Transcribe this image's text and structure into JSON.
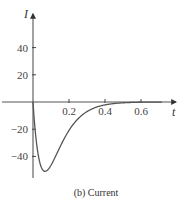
{
  "chart_data": {
    "type": "line",
    "title": "",
    "caption": "(b) Current",
    "xlabel": "t",
    "ylabel": "I",
    "xlim": [
      0,
      0.72
    ],
    "ylim": [
      -55,
      60
    ],
    "x_ticks": [
      0.2,
      0.4,
      0.6
    ],
    "x_tick_labels": [
      "0.2",
      "0.4",
      "0.6"
    ],
    "y_ticks": [
      40,
      20,
      -20,
      -40
    ],
    "y_tick_labels": [
      "40",
      "20",
      "−20",
      "−40"
    ],
    "grid": false,
    "legend": null,
    "series": [
      {
        "name": "I(t)",
        "color": "#555555",
        "x": [
          0,
          0.01,
          0.02,
          0.03,
          0.04,
          0.05,
          0.067,
          0.08,
          0.1,
          0.12,
          0.15,
          0.2,
          0.25,
          0.3,
          0.35,
          0.4,
          0.45,
          0.5,
          0.55,
          0.6,
          0.65,
          0.7
        ],
        "y": [
          0,
          -13,
          -25,
          -34,
          -42,
          -47,
          -51,
          -50,
          -47,
          -42,
          -34,
          -21,
          -12,
          -6.6,
          -3.4,
          -1.7,
          -0.8,
          -0.4,
          -0.2,
          -0.1,
          0,
          0
        ]
      }
    ]
  }
}
